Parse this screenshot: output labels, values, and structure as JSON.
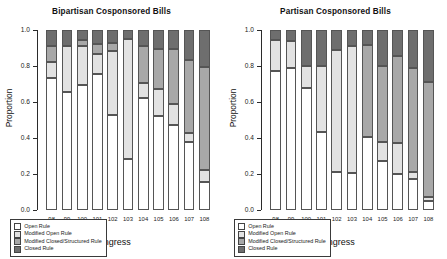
{
  "chart_data": [
    {
      "type": "bar",
      "title": "Bipartisan Cosponsored Bills",
      "xlabel": "Congress",
      "ylabel": "Proportion",
      "ylim": [
        0,
        1
      ],
      "yticks": [
        "0.0",
        "0.2",
        "0.4",
        "0.6",
        "0.8",
        "1.0"
      ],
      "stacked": true,
      "normalized": true,
      "grid": false,
      "legend_position": "bottom-left",
      "categories": [
        "98",
        "99",
        "100",
        "101",
        "102",
        "103",
        "104",
        "105",
        "106",
        "107",
        "108"
      ],
      "series": [
        {
          "name": "Open Rule",
          "color": "#ffffff",
          "values": [
            0.735,
            0.655,
            0.695,
            0.755,
            0.53,
            0.285,
            0.625,
            0.52,
            0.47,
            0.38,
            0.155
          ]
        },
        {
          "name": "Modified Open Rule",
          "color": "#e2e2e2",
          "values": [
            0.09,
            0.255,
            0.215,
            0.11,
            0.355,
            0.665,
            0.08,
            0.15,
            0.12,
            0.05,
            0.065
          ]
        },
        {
          "name": "Modified Closed/Structured Rule",
          "color": "#a8a8a8",
          "values": [
            0.085,
            0.0,
            0.035,
            0.055,
            0.045,
            0.0,
            0.205,
            0.225,
            0.305,
            0.405,
            0.575
          ]
        },
        {
          "name": "Closed Rule",
          "color": "#6e6e6e",
          "values": [
            0.09,
            0.09,
            0.055,
            0.08,
            0.07,
            0.05,
            0.09,
            0.105,
            0.105,
            0.165,
            0.205
          ]
        }
      ]
    },
    {
      "type": "bar",
      "title": "Partisan Cosponsored Bills",
      "xlabel": "Congress",
      "ylabel": "Proportion",
      "ylim": [
        0,
        1
      ],
      "yticks": [
        "0.0",
        "0.2",
        "0.4",
        "0.6",
        "0.8",
        "1.0"
      ],
      "stacked": true,
      "normalized": true,
      "grid": false,
      "legend_position": "bottom-left",
      "categories": [
        "98",
        "99",
        "100",
        "101",
        "102",
        "103",
        "104",
        "105",
        "106",
        "107",
        "108"
      ],
      "series": [
        {
          "name": "Open Rule",
          "color": "#ffffff",
          "values": [
            0.77,
            0.79,
            0.68,
            0.435,
            0.21,
            0.205,
            0.405,
            0.275,
            0.2,
            0.175,
            0.05
          ]
        },
        {
          "name": "Modified Open Rule",
          "color": "#e2e2e2",
          "values": [
            0.175,
            0.15,
            0.12,
            0.365,
            0.68,
            0.705,
            0.0,
            0.105,
            0.175,
            0.035,
            0.02
          ]
        },
        {
          "name": "Modified Closed/Structured Rule",
          "color": "#a8a8a8",
          "values": [
            0.0,
            0.0,
            0.0,
            0.0,
            0.0,
            0.0,
            0.51,
            0.42,
            0.48,
            0.58,
            0.64
          ]
        },
        {
          "name": "Closed Rule",
          "color": "#6e6e6e",
          "values": [
            0.055,
            0.06,
            0.2,
            0.2,
            0.11,
            0.09,
            0.085,
            0.2,
            0.145,
            0.21,
            0.29
          ]
        }
      ]
    }
  ],
  "legend": {
    "items": [
      {
        "label": "Open Rule",
        "color": "#ffffff"
      },
      {
        "label": "Modified Open Rule",
        "color": "#e2e2e2"
      },
      {
        "label": "Modified Closed/Structured Rule",
        "color": "#a8a8a8"
      },
      {
        "label": "Closed Rule",
        "color": "#6e6e6e"
      }
    ]
  }
}
